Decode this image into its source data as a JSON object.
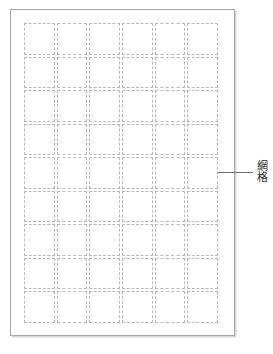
{
  "document": {
    "type": "grid-page-diagram",
    "background_color": "#ffffff"
  },
  "page": {
    "border_color": "#a8a8a8",
    "shadow_color": "#d8d8d8",
    "fill_color": "#ffffff"
  },
  "grid": {
    "columns": 6,
    "rows": 9,
    "total_cells": 54,
    "cell_border_style": "dashed",
    "cell_border_color": "#b9b9b9",
    "cells": [
      "",
      "",
      "",
      "",
      "",
      "",
      "",
      "",
      "",
      "",
      "",
      "",
      "",
      "",
      "",
      "",
      "",
      "",
      "",
      "",
      "",
      "",
      "",
      "",
      "",
      "",
      "",
      "",
      "",
      "",
      "",
      "",
      "",
      "",
      "",
      "",
      "",
      "",
      "",
      "",
      "",
      "",
      "",
      "",
      "",
      "",
      "",
      "",
      "",
      "",
      "",
      "",
      "",
      ""
    ]
  },
  "callout": {
    "label": "網格",
    "line_color": "#6f6f6f"
  }
}
